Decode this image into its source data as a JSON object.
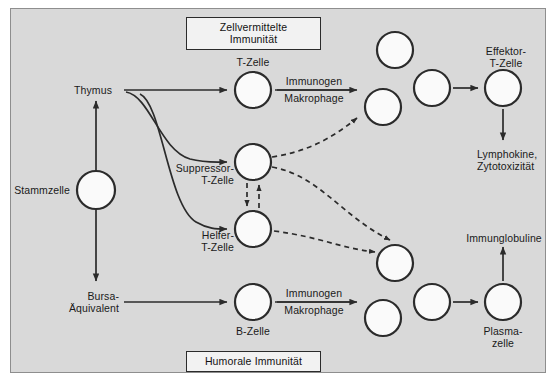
{
  "figure": {
    "domain": "diagram",
    "language": "de",
    "background_color": "#ffffff",
    "panel_color": "#d9d9d9",
    "panel_border_color": "#8e8e8e",
    "ink_color": "#2b2b2b",
    "cell_fill_color": "#fafafa"
  },
  "banners": {
    "top": "Zellvermittelte Immunität",
    "bottom": "Humorale Immunität"
  },
  "labels": {
    "stammzelle": "Stammzelle",
    "thymus": "Thymus",
    "bursa_line1": "Bursa-",
    "bursa_line2": "Äquivalent",
    "t_zelle": "T-Zelle",
    "b_zelle": "B-Zelle",
    "suppressor_line1": "Suppressor-",
    "suppressor_line2": "T-Zelle",
    "helfer_line1": "Helfer-",
    "helfer_line2": "T-Zelle",
    "effektor_line1": "Effektor-",
    "effektor_line2": "T-Zelle",
    "plasma_line1": "Plasma-",
    "plasma_line2": "zelle",
    "immunogen_top": "Immunogen",
    "makrophage_top": "Makrophage",
    "immunogen_bottom": "Immunogen",
    "makrophage_bottom": "Makrophage",
    "lymphokine_line1": "Lymphokine,",
    "lymphokine_line2": "Zytotoxizität",
    "immunglobuline": "Immunglobuline"
  },
  "cells": [
    {
      "id": "stammzelle",
      "cx": 96,
      "cy": 190,
      "r": 19
    },
    {
      "id": "t-zelle",
      "cx": 253,
      "cy": 90,
      "r": 18
    },
    {
      "id": "suppressor",
      "cx": 253,
      "cy": 162,
      "r": 18
    },
    {
      "id": "helfer",
      "cx": 253,
      "cy": 229,
      "r": 18
    },
    {
      "id": "b-zelle",
      "cx": 253,
      "cy": 302,
      "r": 18
    },
    {
      "id": "t-clone-1",
      "cx": 395,
      "cy": 50,
      "r": 18
    },
    {
      "id": "t-clone-2",
      "cx": 383,
      "cy": 107,
      "r": 18
    },
    {
      "id": "t-clone-3",
      "cx": 432,
      "cy": 88,
      "r": 18
    },
    {
      "id": "effektor",
      "cx": 503,
      "cy": 88,
      "r": 18
    },
    {
      "id": "b-clone-1",
      "cx": 395,
      "cy": 263,
      "r": 18
    },
    {
      "id": "b-clone-2",
      "cx": 383,
      "cy": 318,
      "r": 18
    },
    {
      "id": "b-clone-3",
      "cx": 432,
      "cy": 302,
      "r": 18
    },
    {
      "id": "plasmazelle",
      "cx": 503,
      "cy": 302,
      "r": 18
    }
  ],
  "flows": [
    {
      "from": "stammzelle",
      "to": "thymus",
      "style": "solid",
      "note": "vertical up"
    },
    {
      "from": "stammzelle",
      "to": "bursa",
      "style": "solid",
      "note": "vertical down"
    },
    {
      "from": "thymus",
      "to": "t-zelle",
      "style": "solid"
    },
    {
      "from": "thymus",
      "to": "suppressor",
      "style": "solid"
    },
    {
      "from": "thymus",
      "to": "helfer",
      "style": "solid"
    },
    {
      "from": "bursa",
      "to": "b-zelle",
      "style": "solid"
    },
    {
      "from": "t-zelle",
      "to": "t-clones",
      "style": "solid",
      "label": "Immunogen / Makrophage"
    },
    {
      "from": "b-zelle",
      "to": "b-clones",
      "style": "solid",
      "label": "Immunogen / Makrophage"
    },
    {
      "from": "t-clone-3",
      "to": "effektor",
      "style": "solid"
    },
    {
      "from": "b-clone-3",
      "to": "plasmazelle",
      "style": "solid"
    },
    {
      "from": "effektor",
      "to": "lymphokine",
      "style": "solid"
    },
    {
      "from": "plasmazelle",
      "to": "immunglobuline",
      "style": "solid"
    },
    {
      "from": "suppressor",
      "to": "helfer",
      "style": "dashed",
      "note": "down"
    },
    {
      "from": "helfer",
      "to": "suppressor",
      "style": "dashed",
      "note": "up"
    },
    {
      "from": "suppressor",
      "to": "t-clone-2",
      "style": "dashed"
    },
    {
      "from": "suppressor",
      "to": "b-clone-1",
      "style": "dashed"
    },
    {
      "from": "helfer",
      "to": "b-clone-1",
      "style": "dashed"
    }
  ]
}
